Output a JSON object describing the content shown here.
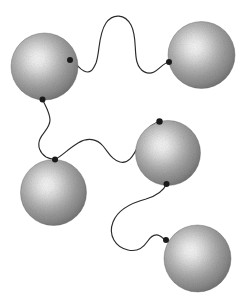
{
  "figure": {
    "title": "Five shaded spheres connected by wavy curves",
    "type": "diagram",
    "width": 239,
    "height": 304,
    "background_color": "#ffffff",
    "style": {
      "sphere_highlight_color": "#f2f2f2",
      "sphere_midtone_color": "#9b9b9b",
      "sphere_rim_color": "#5c5c5c",
      "sphere_edge_color": "#4a4a4a",
      "curve_color": "#2b2b2b",
      "curve_width": 1.15,
      "node_color": "#1a1a1a",
      "texture": "dithered-noise-shading"
    },
    "spheres": [
      {
        "id": "sphere-top-left",
        "label": "Sphere 1",
        "cx": 44.5,
        "cy": 66.5,
        "r": 33.5,
        "highlight_cx": 38,
        "highlight_cy": 60
      },
      {
        "id": "sphere-top-right",
        "label": "Sphere 2",
        "cx": 201.5,
        "cy": 55.0,
        "r": 33.5,
        "highlight_cx": 195,
        "highlight_cy": 48
      },
      {
        "id": "sphere-bottom-left",
        "label": "Sphere 3",
        "cx": 53.5,
        "cy": 192.5,
        "r": 33.0,
        "highlight_cx": 47,
        "highlight_cy": 186
      },
      {
        "id": "sphere-middle-right",
        "label": "Sphere 4",
        "cx": 168.0,
        "cy": 153.0,
        "r": 32.5,
        "highlight_cx": 162,
        "highlight_cy": 147
      },
      {
        "id": "sphere-bottom-right",
        "label": "Sphere 5",
        "cx": 197.5,
        "cy": 258.5,
        "r": 33.5,
        "highlight_cx": 191,
        "highlight_cy": 252
      }
    ],
    "nodes": [
      {
        "id": "node-s1-right",
        "on": "sphere-top-left",
        "x": 70.0,
        "y": 60.0,
        "r": 3.0
      },
      {
        "id": "node-s1-bottom",
        "on": "sphere-top-left",
        "x": 42.5,
        "y": 99.5,
        "r": 3.0
      },
      {
        "id": "node-s2-left",
        "on": "sphere-top-right",
        "x": 169.0,
        "y": 62.0,
        "r": 3.0
      },
      {
        "id": "node-s3-top",
        "on": "sphere-bottom-left",
        "x": 55.0,
        "y": 159.5,
        "r": 3.0
      },
      {
        "id": "node-s4-top",
        "on": "sphere-middle-right",
        "x": 159.5,
        "y": 121.5,
        "r": 3.2
      },
      {
        "id": "node-s4-bottom",
        "on": "sphere-middle-right",
        "x": 166.5,
        "y": 184.0,
        "r": 3.0
      },
      {
        "id": "node-s5-left",
        "on": "sphere-bottom-right",
        "x": 166.0,
        "y": 240.0,
        "r": 3.0
      }
    ],
    "edges": [
      {
        "id": "edge-s1-s2",
        "from": "node-s1-right",
        "to": "node-s2-left",
        "shape": "double-hump-wave",
        "path": "M 70,60 C 76,62 78,68 84,71 C 90,74 93,70 96,63 C 100,52 98,35 106,23 C 113,13 125,14 131,25 C 137,36 134,52 137,62 C 140,72 148,75 154,72 C 160,69 163,63 169,62"
      },
      {
        "id": "edge-s1-s3",
        "from": "node-s1-bottom",
        "to": "node-s3-top",
        "shape": "vertical-s-wave",
        "path": "M 42.5,99.5 C 46,107 50,113 50,120 C 50,128 43,132 40,139 C 37,146 40,153 46,157 C 50,159 52,159 55,159.5"
      },
      {
        "id": "edge-s3-s4",
        "from": "node-s3-top",
        "to": "node-s4-top",
        "shape": "sinuous-wave",
        "path": "M 55,159.5 C 62,156 68,149 78,143 C 88,137 97,139 103,146 C 109,153 112,160 120,162 C 128,164 133,157 138,146 C 143,135 148,125 159.5,121.5"
      },
      {
        "id": "edge-s4-s5",
        "from": "node-s4-bottom",
        "to": "node-s5-left",
        "shape": "large-left-loop-wave",
        "path": "M 166.5,184 C 163,192 156,196 146,199 C 131,203 118,209 113,222 C 108,235 115,247 128,250 C 137,252 143,248 147,242 C 151,236 155,233 160,236 C 163,238 164,239 166,240"
      }
    ]
  }
}
